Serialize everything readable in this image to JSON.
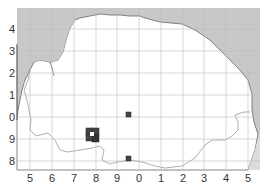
{
  "map": {
    "colors": {
      "sea": "#c8c8c8",
      "land": "#ffffff",
      "grid": "#bdbdbd",
      "coast": "#666666",
      "marker": "#444444"
    },
    "x_labels": [
      "5",
      "6",
      "7",
      "8",
      "9",
      "0",
      "1",
      "2",
      "3",
      "4",
      "5"
    ],
    "y_labels": [
      "4",
      "3",
      "2",
      "1",
      "0",
      "9",
      "8"
    ],
    "markers": [
      {
        "x": 88,
        "y": 130,
        "size": 6
      },
      {
        "x": 94,
        "y": 130,
        "size": 6
      },
      {
        "x": 88,
        "y": 136,
        "size": 6
      },
      {
        "x": 91,
        "y": 137,
        "size": 6
      },
      {
        "x": 97,
        "y": 137,
        "size": 6
      },
      {
        "x": 126,
        "y": 113,
        "size": 5
      },
      {
        "x": 126,
        "y": 156,
        "size": 5
      }
    ]
  }
}
